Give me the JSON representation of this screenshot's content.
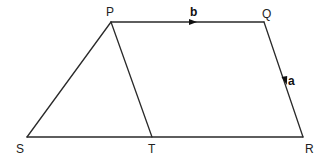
{
  "diagram": {
    "type": "vector-geometry",
    "shape": "trapezium PQRS with segment PT",
    "points": {
      "P": {
        "label": "P",
        "x": 111,
        "y": 22
      },
      "Q": {
        "label": "Q",
        "x": 264,
        "y": 22
      },
      "R": {
        "label": "R",
        "x": 303,
        "y": 137
      },
      "S": {
        "label": "S",
        "x": 27,
        "y": 137
      },
      "T": {
        "label": "T",
        "x": 152,
        "y": 137
      }
    },
    "segments": [
      "PQ",
      "QR",
      "RS",
      "SP",
      "PT"
    ],
    "vectors": [
      {
        "label": "b",
        "on": "PQ",
        "direction": "P to Q"
      },
      {
        "label": "a",
        "on": "QR",
        "direction": "Q to R"
      }
    ],
    "stroke_color": "#2a2a2a",
    "background": "#ffffff"
  }
}
